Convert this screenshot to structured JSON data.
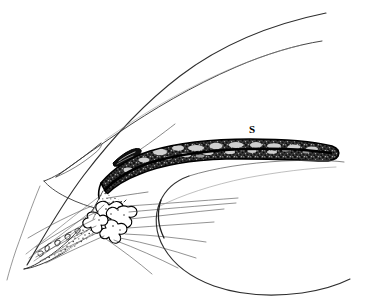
{
  "figure": {
    "kind": "anatomical-line-drawing",
    "background_color": "#ffffff",
    "ink_color": "#000000",
    "thin_line_color": "#3a3a3a",
    "width": 386,
    "height": 302
  },
  "labels": [
    {
      "id": "s",
      "text": "S",
      "x": 252,
      "y": 129,
      "style": "bold"
    }
  ],
  "structures": [
    {
      "id": "cornea-outer",
      "name": "Outer corneal surface",
      "stroke": "#2e2e2e",
      "stroke_width": 1.1,
      "fill": "none"
    },
    {
      "id": "cornea-inner",
      "name": "Inner corneal surface",
      "stroke": "#3a3a3a",
      "stroke_width": 1.0,
      "fill": "none"
    },
    {
      "id": "limbus-wedge",
      "name": "Limbal / scleral wedge",
      "stroke": "#3a3a3a",
      "stroke_width": 1.0,
      "fill": "none"
    },
    {
      "id": "schlemm-canal",
      "name": "Schlemm canal",
      "stroke": "#000000",
      "stroke_width": 1.2,
      "fill": "#000000"
    },
    {
      "id": "iris",
      "name": "Iris (stippled)",
      "stroke": "#000000",
      "stroke_width": 1.6,
      "fill": "#2b2b2b"
    },
    {
      "id": "ciliary-body",
      "name": "Ciliary body",
      "stroke": "#2e2e2e",
      "stroke_width": 1.0,
      "fill": "none"
    },
    {
      "id": "ciliary-processes",
      "name": "Ciliary processes",
      "stroke": "#000000",
      "stroke_width": 1.1,
      "fill": "none"
    },
    {
      "id": "zonular-fibers",
      "name": "Zonular fibers",
      "stroke": "#4a4a4a",
      "stroke_width": 0.6,
      "fill": "none"
    },
    {
      "id": "lens-capsule",
      "name": "Anterior lens capsule",
      "stroke": "#2e2e2e",
      "stroke_width": 1.1,
      "fill": "none"
    },
    {
      "id": "posterior-chamber-line",
      "name": "Posterior chamber boundary",
      "stroke": "#555555",
      "stroke_width": 0.7,
      "fill": "none"
    }
  ]
}
